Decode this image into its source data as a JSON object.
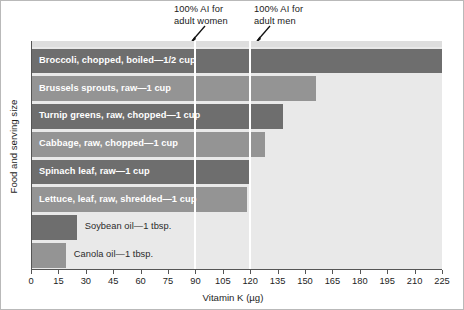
{
  "chart_data": {
    "type": "bar",
    "orientation": "horizontal",
    "title": "",
    "xlabel": "Vitamin K (µg)",
    "ylabel": "Food and serving size",
    "xlim": [
      0,
      225
    ],
    "xticks": [
      0,
      15,
      30,
      45,
      60,
      75,
      90,
      105,
      120,
      135,
      150,
      165,
      180,
      195,
      210,
      225
    ],
    "grid": false,
    "legend": "none",
    "categories": [
      "Broccoli, chopped, boiled—1/2 cup",
      "Brussels sprouts, raw—1 cup",
      "Turnip greens, raw, chopped—1 cup",
      "Cabbage, raw, chopped—1 cup",
      "Spinach leaf, raw—1 cup",
      "Lettuce, leaf, raw, shredded—1 cup",
      "Soybean oil—1 tbsp.",
      "Canola oil—1 tbsp."
    ],
    "values": [
      225,
      156,
      138,
      128,
      120,
      118,
      25,
      19
    ],
    "bar_shades": [
      "dark",
      "light",
      "dark",
      "light",
      "dark",
      "light",
      "dark",
      "light"
    ],
    "label_placement": [
      "inside",
      "inside",
      "inside",
      "inside",
      "inside",
      "inside",
      "outside",
      "outside"
    ],
    "annotations": [
      {
        "text": "100% AI for\nadult women",
        "value": 90
      },
      {
        "text": "100% AI for\nadult men",
        "value": 120
      }
    ],
    "reference_lines": [
      90,
      120
    ]
  },
  "colors": {
    "plot_background": "#e9e9e9",
    "bar_dark": "#6e6e6e",
    "bar_light": "#949494",
    "reference_line": "#ffffff",
    "axis": "#555555",
    "text": "#1d1d1d",
    "inside_label": "#ffffff"
  }
}
